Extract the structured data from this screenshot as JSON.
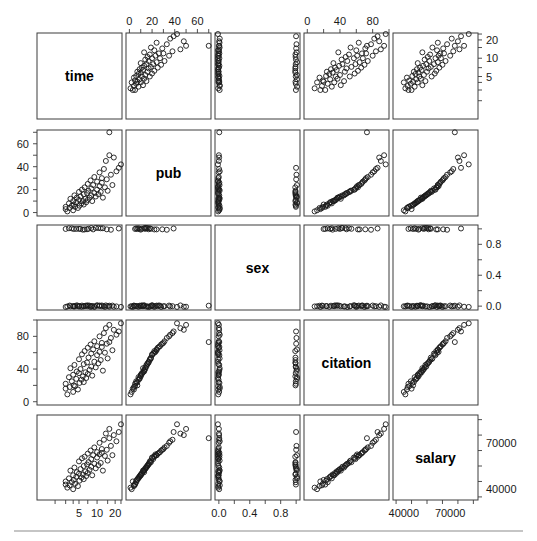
{
  "figure": {
    "type": "scatterplot-matrix",
    "variables": [
      "time",
      "pub",
      "sex",
      "citation",
      "salary"
    ],
    "n_points": 62,
    "background_color": "#ffffff",
    "point_color": "#1a1a1a",
    "frame_color": "#3c3c3c",
    "footer_rule": true
  },
  "diagonal_labels": [
    {
      "name": "time",
      "row": 0,
      "col": 0
    },
    {
      "name": "pub",
      "row": 1,
      "col": 1
    },
    {
      "name": "sex",
      "row": 2,
      "col": 2
    },
    {
      "name": "citation",
      "row": 3,
      "col": 3
    },
    {
      "name": "salary",
      "row": 4,
      "col": 4
    }
  ],
  "axes": [
    {
      "variable": "time",
      "side_top": null,
      "side_bottom": {
        "ticks": [
          5,
          10,
          20
        ],
        "labels": [
          "5",
          "10",
          "20"
        ],
        "minor_ticks": [
          2,
          3,
          4,
          5,
          7,
          10,
          15,
          20,
          25
        ]
      },
      "side_left": null,
      "side_right": {
        "ticks": [
          5,
          10,
          20
        ],
        "labels": [
          "5",
          "10",
          "20"
        ],
        "minor_ticks": [
          2,
          3,
          4,
          5,
          7,
          10,
          15,
          20,
          25
        ]
      },
      "scale": "log-like",
      "range": [
        1,
        26
      ]
    },
    {
      "variable": "pub",
      "side_top": {
        "ticks": [
          0,
          20,
          40,
          60
        ],
        "labels": [
          "0",
          "20",
          "40",
          "60"
        ],
        "minor_ticks": [
          0,
          10,
          20,
          30,
          40,
          50,
          60,
          70
        ]
      },
      "side_left": {
        "ticks": [
          0,
          20,
          40,
          60
        ],
        "labels": [
          "0",
          "20",
          "40",
          "60"
        ],
        "minor_ticks": [
          0,
          10,
          20,
          30,
          40,
          50,
          60,
          70
        ]
      },
      "range": [
        -3,
        72
      ]
    },
    {
      "variable": "sex",
      "side_bottom": {
        "ticks": [
          0.0,
          0.4,
          0.8
        ],
        "labels": [
          "0.0",
          "0.4",
          "0.8"
        ],
        "minor_ticks": [
          0.0,
          0.2,
          0.4,
          0.6,
          0.8,
          1.0
        ]
      },
      "side_right": {
        "ticks": [
          0.0,
          0.4,
          0.8
        ],
        "labels": [
          "0.0",
          "0.4",
          "0.8"
        ],
        "minor_ticks": [
          0.0,
          0.2,
          0.4,
          0.6,
          0.8,
          1.0
        ]
      },
      "range": [
        -0.05,
        1.05
      ]
    },
    {
      "variable": "citation",
      "side_top": {
        "ticks": [
          0,
          40,
          80
        ],
        "labels": [
          "0",
          "40",
          "80"
        ],
        "minor_ticks": [
          0,
          20,
          40,
          60,
          80,
          100
        ]
      },
      "side_left": {
        "ticks": [
          0,
          40,
          80
        ],
        "labels": [
          "0",
          "40",
          "80"
        ],
        "minor_ticks": [
          0,
          20,
          40,
          60,
          80,
          100
        ]
      },
      "range": [
        -4,
        100
      ]
    },
    {
      "variable": "salary",
      "side_bottom": {
        "ticks": [
          40000,
          70000
        ],
        "labels": [
          "40000",
          "70000"
        ],
        "minor_ticks": [
          35000,
          45000,
          55000,
          65000,
          75000,
          85000
        ]
      },
      "side_right": {
        "ticks": [
          40000,
          70000
        ],
        "labels": [
          "40000",
          "70000"
        ],
        "minor_ticks": [
          35000,
          45000,
          55000,
          65000,
          75000,
          85000
        ]
      },
      "range": [
        33000,
        88000
      ]
    }
  ],
  "chart_data": {
    "type": "scatter",
    "title": "",
    "xlabel": "",
    "ylabel": "",
    "variables": [
      "time",
      "pub",
      "sex",
      "citation",
      "salary"
    ],
    "axis_ranges": {
      "time": [
        1,
        26
      ],
      "pub": [
        -3,
        72
      ],
      "sex": [
        -0.05,
        1.05
      ],
      "citation": [
        -4,
        100
      ],
      "salary": [
        33000,
        88000
      ]
    },
    "legend": null,
    "grid": false,
    "observations": [
      {
        "time": 3.0,
        "pub": 3,
        "sex": 0,
        "citation": 16,
        "salary": 45000
      },
      {
        "time": 3.0,
        "pub": 5,
        "sex": 1,
        "citation": 22,
        "salary": 43000
      },
      {
        "time": 3.2,
        "pub": 1,
        "sex": 0,
        "citation": 9,
        "salary": 41000
      },
      {
        "time": 3.4,
        "pub": 8,
        "sex": 1,
        "citation": 30,
        "salary": 47000
      },
      {
        "time": 3.5,
        "pub": 4,
        "sex": 0,
        "citation": 18,
        "salary": 42500
      },
      {
        "time": 3.6,
        "pub": 12,
        "sex": 0,
        "citation": 41,
        "salary": 52000
      },
      {
        "time": 3.8,
        "pub": 6,
        "sex": 1,
        "citation": 25,
        "salary": 44500
      },
      {
        "time": 4.0,
        "pub": 2,
        "sex": 0,
        "citation": 12,
        "salary": 40000
      },
      {
        "time": 4.0,
        "pub": 10,
        "sex": 0,
        "citation": 33,
        "salary": 49000
      },
      {
        "time": 4.1,
        "pub": 7,
        "sex": 1,
        "citation": 20,
        "salary": 46000
      },
      {
        "time": 4.2,
        "pub": 15,
        "sex": 0,
        "citation": 45,
        "salary": 54000
      },
      {
        "time": 4.3,
        "pub": 5,
        "sex": 0,
        "citation": 19,
        "salary": 43500
      },
      {
        "time": 4.5,
        "pub": 9,
        "sex": 1,
        "citation": 28,
        "salary": 48000
      },
      {
        "time": 4.6,
        "pub": 13,
        "sex": 0,
        "citation": 37,
        "salary": 51000
      },
      {
        "time": 4.8,
        "pub": 4,
        "sex": 0,
        "citation": 15,
        "salary": 42000
      },
      {
        "time": 5.0,
        "pub": 11,
        "sex": 1,
        "citation": 35,
        "salary": 50000
      },
      {
        "time": 5.0,
        "pub": 18,
        "sex": 0,
        "citation": 52,
        "salary": 58000
      },
      {
        "time": 5.1,
        "pub": 6,
        "sex": 0,
        "citation": 23,
        "salary": 45500
      },
      {
        "time": 5.3,
        "pub": 14,
        "sex": 1,
        "citation": 40,
        "salary": 53000
      },
      {
        "time": 5.5,
        "pub": 8,
        "sex": 0,
        "citation": 27,
        "salary": 47500
      },
      {
        "time": 5.6,
        "pub": 20,
        "sex": 0,
        "citation": 58,
        "salary": 60000
      },
      {
        "time": 5.8,
        "pub": 10,
        "sex": 1,
        "citation": 31,
        "salary": 49500
      },
      {
        "time": 6.0,
        "pub": 16,
        "sex": 0,
        "citation": 46,
        "salary": 55000
      },
      {
        "time": 6.0,
        "pub": 7,
        "sex": 0,
        "citation": 24,
        "salary": 46500
      },
      {
        "time": 6.2,
        "pub": 22,
        "sex": 1,
        "citation": 62,
        "salary": 61000
      },
      {
        "time": 6.4,
        "pub": 12,
        "sex": 0,
        "citation": 36,
        "salary": 51500
      },
      {
        "time": 6.6,
        "pub": 9,
        "sex": 0,
        "citation": 29,
        "salary": 48500
      },
      {
        "time": 6.8,
        "pub": 17,
        "sex": 1,
        "citation": 48,
        "salary": 56000
      },
      {
        "time": 7.0,
        "pub": 25,
        "sex": 0,
        "citation": 66,
        "salary": 63000
      },
      {
        "time": 7.0,
        "pub": 11,
        "sex": 0,
        "citation": 34,
        "salary": 50500
      },
      {
        "time": 7.2,
        "pub": 19,
        "sex": 1,
        "citation": 54,
        "salary": 57500
      },
      {
        "time": 7.5,
        "pub": 13,
        "sex": 0,
        "citation": 39,
        "salary": 52500
      },
      {
        "time": 7.8,
        "pub": 28,
        "sex": 0,
        "citation": 70,
        "salary": 65000
      },
      {
        "time": 8.0,
        "pub": 15,
        "sex": 1,
        "citation": 43,
        "salary": 54500
      },
      {
        "time": 8.0,
        "pub": 21,
        "sex": 0,
        "citation": 59,
        "salary": 59500
      },
      {
        "time": 8.3,
        "pub": 10,
        "sex": 0,
        "citation": 32,
        "salary": 49000
      },
      {
        "time": 8.6,
        "pub": 24,
        "sex": 1,
        "citation": 64,
        "salary": 62000
      },
      {
        "time": 9.0,
        "pub": 17,
        "sex": 0,
        "citation": 49,
        "salary": 56500
      },
      {
        "time": 9.0,
        "pub": 31,
        "sex": 0,
        "citation": 74,
        "salary": 67000
      },
      {
        "time": 9.5,
        "pub": 14,
        "sex": 1,
        "citation": 42,
        "salary": 53500
      },
      {
        "time": 10.0,
        "pub": 20,
        "sex": 0,
        "citation": 57,
        "salary": 60500
      },
      {
        "time": 10.0,
        "pub": 27,
        "sex": 0,
        "citation": 68,
        "salary": 64000
      },
      {
        "time": 10.5,
        "pub": 16,
        "sex": 1,
        "citation": 47,
        "salary": 55500
      },
      {
        "time": 11.0,
        "pub": 35,
        "sex": 0,
        "citation": 80,
        "salary": 70000
      },
      {
        "time": 11.0,
        "pub": 23,
        "sex": 0,
        "citation": 61,
        "salary": 62500
      },
      {
        "time": 11.5,
        "pub": 18,
        "sex": 1,
        "citation": 51,
        "salary": 57000
      },
      {
        "time": 12.0,
        "pub": 30,
        "sex": 0,
        "citation": 72,
        "salary": 66000
      },
      {
        "time": 12.0,
        "pub": 26,
        "sex": 0,
        "citation": 67,
        "salary": 63500
      },
      {
        "time": 12.5,
        "pub": 13,
        "sex": 1,
        "citation": 38,
        "salary": 52000
      },
      {
        "time": 13.0,
        "pub": 38,
        "sex": 0,
        "citation": 84,
        "salary": 72000
      },
      {
        "time": 13.5,
        "pub": 22,
        "sex": 0,
        "citation": 60,
        "salary": 61500
      },
      {
        "time": 14.0,
        "pub": 45,
        "sex": 0,
        "citation": 90,
        "salary": 76000
      },
      {
        "time": 14.5,
        "pub": 29,
        "sex": 1,
        "citation": 71,
        "salary": 65500
      },
      {
        "time": 15.0,
        "pub": 19,
        "sex": 0,
        "citation": 53,
        "salary": 58500
      },
      {
        "time": 16.0,
        "pub": 50,
        "sex": 0,
        "citation": 94,
        "salary": 79000
      },
      {
        "time": 16.0,
        "pub": 70,
        "sex": 0,
        "citation": 73,
        "salary": 73000
      },
      {
        "time": 17.0,
        "pub": 33,
        "sex": 1,
        "citation": 78,
        "salary": 68000
      },
      {
        "time": 18.0,
        "pub": 24,
        "sex": 0,
        "citation": 63,
        "salary": 62000
      },
      {
        "time": 19.0,
        "pub": 48,
        "sex": 0,
        "citation": 88,
        "salary": 75000
      },
      {
        "time": 21.0,
        "pub": 36,
        "sex": 0,
        "citation": 82,
        "salary": 71000
      },
      {
        "time": 23.0,
        "pub": 39,
        "sex": 1,
        "citation": 86,
        "salary": 77000
      },
      {
        "time": 25.0,
        "pub": 42,
        "sex": 0,
        "citation": 96,
        "salary": 82000
      }
    ]
  }
}
